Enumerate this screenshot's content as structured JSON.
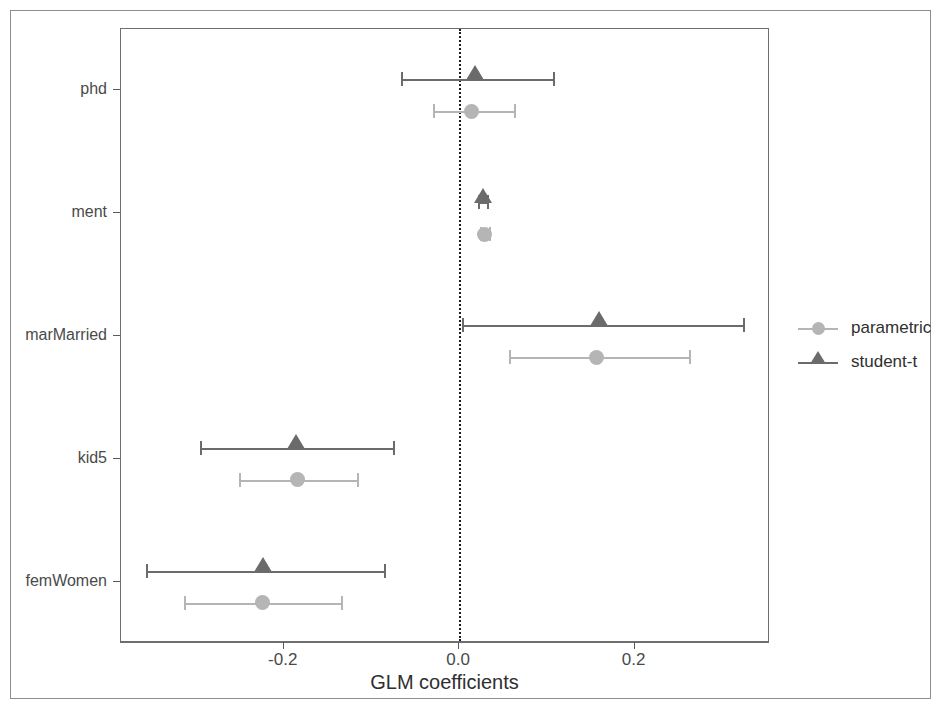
{
  "chart_data": {
    "type": "scatter",
    "title": "",
    "subtitle": "",
    "xlabel": "GLM coefficients",
    "ylabel": "",
    "xlim": [
      -0.3856,
      0.3544
    ],
    "xticks": [
      -0.2,
      0.0,
      0.2
    ],
    "xticklabels": [
      "-0.2",
      "0.0",
      "0.2"
    ],
    "categories": [
      "phd",
      "ment",
      "marMarried",
      "kid5",
      "femWomen"
    ],
    "grid": false,
    "legend_position": "right",
    "reference_line": {
      "x": 0.0,
      "style": "dotted",
      "color": "#1c1c1c"
    },
    "series": [
      {
        "name": "parametric",
        "marker": "circle",
        "color": "#b5b5b5",
        "values": [
          0.014,
          0.029,
          0.157,
          -0.184,
          -0.224
        ],
        "ci_low": [
          -0.03,
          0.024,
          0.057,
          -0.251,
          -0.314
        ],
        "ci_high": [
          0.062,
          0.034,
          0.262,
          -0.117,
          -0.135
        ]
      },
      {
        "name": "student-t",
        "marker": "triangle",
        "color": "#6b6b6b",
        "values": [
          0.018,
          0.027,
          0.159,
          -0.186,
          -0.224
        ],
        "ci_low": [
          -0.066,
          0.022,
          0.003,
          -0.295,
          -0.357
        ],
        "ci_high": [
          0.107,
          0.032,
          0.324,
          -0.075,
          -0.086
        ]
      }
    ]
  },
  "legend": {
    "entries": [
      {
        "label": "parametric",
        "marker_name": "circle-marker-icon"
      },
      {
        "label": "student-t",
        "marker_name": "triangle-marker-icon"
      }
    ]
  },
  "axis": {
    "x_title": "GLM coefficients",
    "x_tick_labels": [
      "-0.2",
      "0.0",
      "0.2"
    ],
    "y_tick_labels": [
      "phd",
      "ment",
      "marMarried",
      "kid5",
      "femWomen"
    ]
  }
}
